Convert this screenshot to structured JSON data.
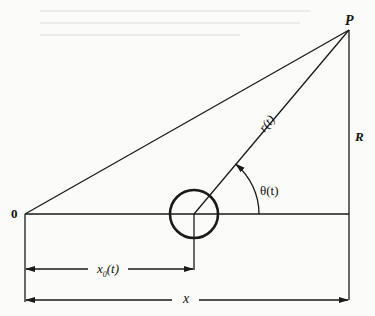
{
  "figure": {
    "labels": {
      "point_p": "P",
      "origin": "0",
      "distance_r_label": "R",
      "radius": "r(t)",
      "angle": "θ(t)",
      "offset_x0_main": "x",
      "offset_x0_sub": "0",
      "offset_x0_suffix": "(t)",
      "distance_x": "x"
    },
    "geometry": {
      "origin": [
        25,
        214
      ],
      "point_p": [
        349,
        30
      ],
      "circle_center": [
        194,
        214
      ],
      "circle_radius": 24,
      "baseline_right_x": 349,
      "x0_arrow_y": 269,
      "x_arrow_y": 300,
      "angle_arc_radius": 65
    },
    "colors": {
      "line": "#1a1a1a",
      "background": "#fbfbfa",
      "ghost_text": "#d8d8d4"
    }
  }
}
